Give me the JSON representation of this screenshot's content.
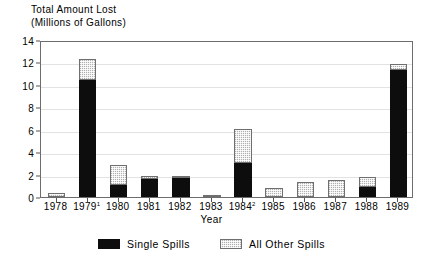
{
  "chart_data": {
    "type": "bar",
    "stacked": true,
    "title": "Total Amount Lost",
    "subtitle": "(Millions of Gallons)",
    "xlabel": "Year",
    "ylabel": "",
    "ylim": [
      0,
      14
    ],
    "yticks": [
      0,
      2,
      4,
      6,
      8,
      10,
      12,
      14
    ],
    "grid": true,
    "legend_position": "bottom",
    "categories": [
      "1978",
      "1979",
      "1980",
      "1981",
      "1982",
      "1983",
      "1984",
      "1985",
      "1986",
      "1987",
      "1988",
      "1989"
    ],
    "category_footnotes": [
      "",
      "1",
      "",
      "",
      "",
      "",
      "2",
      "",
      "",
      "",
      "",
      ""
    ],
    "series": [
      {
        "name": "Single Spills",
        "color": "#0d0d0d",
        "values": [
          0,
          10.4,
          1.1,
          1.6,
          1.7,
          0,
          3.0,
          0,
          0,
          0,
          0.9,
          11.3
        ]
      },
      {
        "name": "All Other Spills",
        "color": "#b0b0b0",
        "values": [
          0.35,
          1.9,
          1.8,
          0.3,
          0.1,
          0.15,
          3.1,
          0.8,
          1.3,
          1.5,
          0.9,
          0.6
        ]
      }
    ],
    "totals": [
      0.35,
      12.3,
      2.9,
      1.9,
      1.8,
      0.15,
      6.1,
      0.8,
      1.3,
      1.5,
      1.8,
      11.9
    ]
  },
  "legend": {
    "items": [
      {
        "label": "Single Spills",
        "swatch": "solid-black-swatch"
      },
      {
        "label": "All Other Spills",
        "swatch": "hatched-gray-swatch"
      }
    ]
  }
}
